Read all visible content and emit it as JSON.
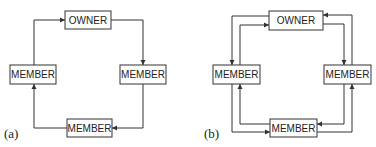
{
  "panels": [
    {
      "caption": "(a)",
      "nodes": {
        "top": "OWNER",
        "left": "MEMBER",
        "right": "MEMBER",
        "bottom": "MEMBER"
      },
      "links": "single-direction ring: OWNER → right MEMBER → bottom MEMBER → left MEMBER → OWNER"
    },
    {
      "caption": "(b)",
      "nodes": {
        "top": "OWNER",
        "left": "MEMBER",
        "right": "MEMBER",
        "bottom": "MEMBER"
      },
      "links": "bidirectional ring: each adjacent pair connected by two opposing arrows"
    }
  ]
}
